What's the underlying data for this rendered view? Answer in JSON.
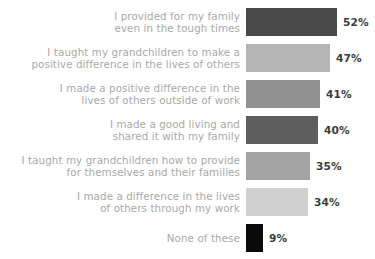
{
  "chart_data": {
    "type": "bar",
    "orientation": "horizontal",
    "title": "",
    "subtitle": "",
    "xlabel": "",
    "ylabel": "",
    "grid": false,
    "legend": "none",
    "axis_visible": false,
    "value_suffix": "%",
    "xlim": [
      0,
      100
    ],
    "background_color": "#ffffff",
    "label_color": "#a9a9a9",
    "value_color": "#3c3c3c",
    "categories": [
      "I provided for my family\neven in the tough times",
      "I taught my grandchildren to make a\npositive difference in the lives of others",
      "I made a positive difference in the\nlives of others outside of work",
      "I made a good living and\nshared it with my family",
      "I taught my grandchildren how to provide\nfor themselves and their families",
      "I made a difference in the lives\nof others through my work",
      "None of these"
    ],
    "values": [
      52,
      47,
      41,
      40,
      35,
      34,
      9
    ],
    "value_labels": [
      "52%",
      "47%",
      "41%",
      "40%",
      "35%",
      "34%",
      "9%"
    ],
    "bar_colors": [
      "#4a4a4a",
      "#b5b5b5",
      "#919191",
      "#5e5e5e",
      "#a3a3a3",
      "#d0d0d0",
      "#0a0a0a"
    ],
    "bar_pixel_widths": [
      91,
      84,
      74,
      72,
      64,
      62,
      17
    ],
    "row_tops": [
      7,
      43,
      79,
      115,
      151,
      187,
      223
    ]
  }
}
